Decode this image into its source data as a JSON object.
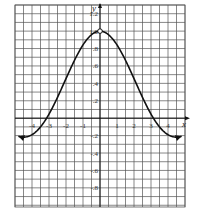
{
  "chart_data": {
    "type": "line",
    "title": "",
    "xlabel": "x",
    "ylabel": "y",
    "function": "sin(x)/x",
    "xlim": [
      -5,
      5
    ],
    "ylim": [
      -1.02,
      1.3
    ],
    "grid": true,
    "grid_step_x": 0.5,
    "grid_step_y": 0.1,
    "x_ticks": [
      -4,
      -3,
      -2,
      -1,
      1,
      2,
      3,
      4
    ],
    "x_tick_labels": [
      "-4",
      "-3",
      "-2",
      "-1",
      "1",
      "2",
      "3",
      "4"
    ],
    "y_ticks": [
      1.2,
      1.0,
      0.8,
      0.6,
      0.4,
      0.2,
      -0.2,
      -0.4,
      -0.6,
      -0.8
    ],
    "y_tick_labels": [
      "1.2",
      "1.0",
      ".8",
      ".6",
      ".4",
      ".2",
      "-.2",
      "-.4",
      "-.6",
      "-.8"
    ],
    "open_point": {
      "x": 0,
      "y": 1.0
    },
    "arrows_both_ends": true,
    "series": [
      {
        "name": "y = sin(x)/x",
        "x": [
          -4.8,
          -4.5,
          -4,
          -3.5,
          -3,
          -2.5,
          -2,
          -1.5,
          -1,
          -0.5,
          0,
          0.5,
          1,
          1.5,
          2,
          2.5,
          3,
          3.5,
          4,
          4.5,
          4.8
        ],
        "y": [
          -0.21,
          -0.22,
          -0.19,
          -0.1,
          0.05,
          0.24,
          0.45,
          0.66,
          0.84,
          0.96,
          1.0,
          0.96,
          0.84,
          0.66,
          0.45,
          0.24,
          0.05,
          -0.1,
          -0.19,
          -0.22,
          -0.21
        ]
      }
    ]
  },
  "colors": {
    "grid": "#555555",
    "curve": "#111111",
    "background": "#ffffff"
  }
}
